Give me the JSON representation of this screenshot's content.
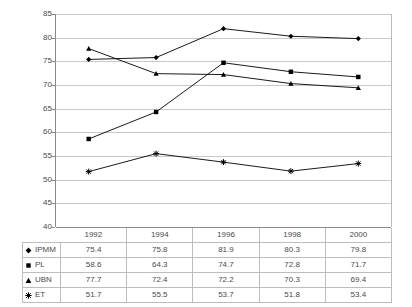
{
  "chart_data": {
    "type": "line",
    "title": "",
    "xlabel": "",
    "ylabel": "",
    "categories": [
      "1992",
      "1994",
      "1996",
      "1998",
      "2000"
    ],
    "ylim": [
      40,
      85
    ],
    "yticks": [
      40,
      45,
      50,
      55,
      60,
      65,
      70,
      75,
      80,
      85
    ],
    "grid": true,
    "legend_position": "data-table-below",
    "series": [
      {
        "name": "IPMM",
        "marker": "diamond",
        "color": "#000000",
        "values": [
          75.4,
          75.8,
          81.9,
          80.3,
          79.8
        ]
      },
      {
        "name": "PL",
        "marker": "square",
        "color": "#000000",
        "values": [
          58.6,
          64.3,
          74.7,
          72.8,
          71.7
        ]
      },
      {
        "name": "UBN",
        "marker": "triangle",
        "color": "#000000",
        "values": [
          77.7,
          72.4,
          72.2,
          70.3,
          69.4
        ]
      },
      {
        "name": "ET",
        "marker": "asterisk",
        "color": "#000000",
        "values": [
          51.7,
          55.5,
          53.7,
          51.8,
          53.4
        ]
      }
    ]
  },
  "table": {
    "header": [
      "",
      "1992",
      "1994",
      "1996",
      "1998",
      "2000"
    ],
    "rows": [
      {
        "label": "IPMM",
        "marker": "diamond",
        "values": [
          "75.4",
          "75.8",
          "81.9",
          "80.3",
          "79.8"
        ]
      },
      {
        "label": "PL",
        "marker": "square",
        "values": [
          "58.6",
          "64.3",
          "74.7",
          "72.8",
          "71.7"
        ]
      },
      {
        "label": "UBN",
        "marker": "triangle",
        "values": [
          "77.7",
          "72.4",
          "72.2",
          "70.3",
          "69.4"
        ]
      },
      {
        "label": "ET",
        "marker": "asterisk",
        "values": [
          "51.7",
          "55.5",
          "53.7",
          "51.8",
          "53.4"
        ]
      }
    ]
  },
  "axis": {
    "y_tick_labels": [
      "85",
      "80",
      "75",
      "70",
      "65",
      "60",
      "55",
      "50",
      "45",
      "40"
    ]
  },
  "colors": {
    "gridline": "#c9c9c9",
    "axis": "#8a8a8a",
    "series": "#000000",
    "text": "#4a4a4a",
    "table_border": "#bdbdbd"
  }
}
